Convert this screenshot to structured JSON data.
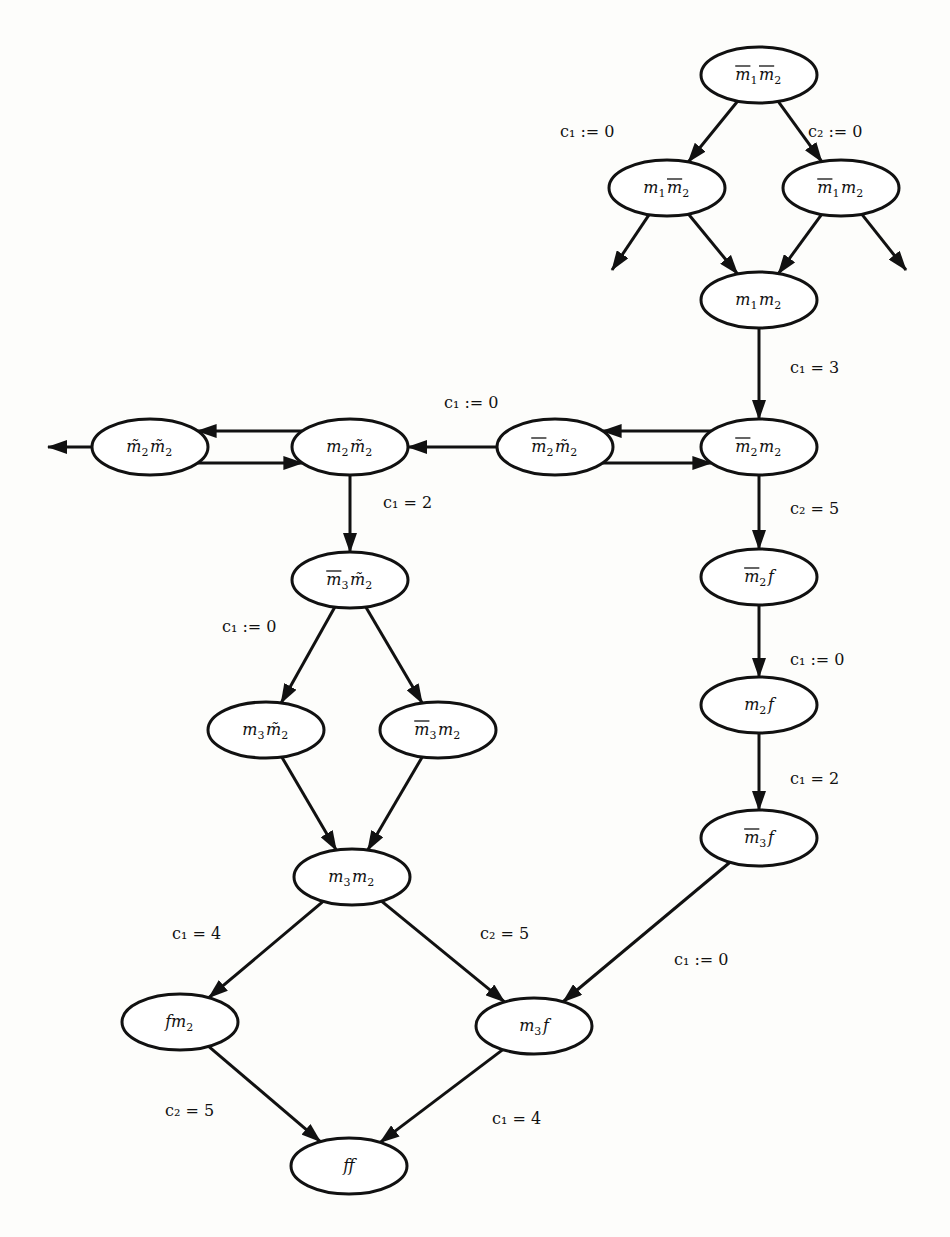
{
  "diagram": {
    "type": "state-transition-graph",
    "nodes": [
      {
        "id": "n1",
        "label": "m̄₁m̄₂",
        "parts": [
          {
            "b": "m",
            "s": "1",
            "bar": true
          },
          {
            "b": "m",
            "s": "2",
            "bar": true
          }
        ],
        "x": 759,
        "y": 75
      },
      {
        "id": "n2",
        "label": "m₁m̄₂",
        "parts": [
          {
            "b": "m",
            "s": "1",
            "bar": false
          },
          {
            "b": "m",
            "s": "2",
            "bar": true
          }
        ],
        "x": 667,
        "y": 188
      },
      {
        "id": "n3",
        "label": "m̄₁m₂",
        "parts": [
          {
            "b": "m",
            "s": "1",
            "bar": true
          },
          {
            "b": "m",
            "s": "2",
            "bar": false
          }
        ],
        "x": 841,
        "y": 188
      },
      {
        "id": "n4",
        "label": "m₁m₂",
        "parts": [
          {
            "b": "m",
            "s": "1",
            "bar": false
          },
          {
            "b": "m",
            "s": "2",
            "bar": false
          }
        ],
        "x": 759,
        "y": 300
      },
      {
        "id": "n5",
        "label": "m̄₂m₂",
        "parts": [
          {
            "b": "m",
            "s": "2",
            "bar": true
          },
          {
            "b": "m",
            "s": "2",
            "bar": false
          }
        ],
        "x": 759,
        "y": 447
      },
      {
        "id": "n6",
        "label": "m̄₂m̃₂",
        "parts": [
          {
            "b": "m",
            "s": "2",
            "bar": true
          },
          {
            "b": "m̃",
            "s": "2",
            "bar": false
          }
        ],
        "x": 555,
        "y": 447
      },
      {
        "id": "n7",
        "label": "m₂m̃₂",
        "parts": [
          {
            "b": "m",
            "s": "2",
            "bar": false
          },
          {
            "b": "m̃",
            "s": "2",
            "bar": false
          }
        ],
        "x": 350,
        "y": 447
      },
      {
        "id": "n8",
        "label": "m̃₂m̃₂",
        "parts": [
          {
            "b": "m̃",
            "s": "2",
            "bar": false
          },
          {
            "b": "m̃",
            "s": "2",
            "bar": false
          }
        ],
        "x": 150,
        "y": 447
      },
      {
        "id": "n9",
        "label": "m̄₃m̃₂",
        "parts": [
          {
            "b": "m",
            "s": "3",
            "bar": true
          },
          {
            "b": "m̃",
            "s": "2",
            "bar": false
          }
        ],
        "x": 350,
        "y": 580
      },
      {
        "id": "n10",
        "label": "m₃m̃₂",
        "parts": [
          {
            "b": "m",
            "s": "3",
            "bar": false
          },
          {
            "b": "m̃",
            "s": "2",
            "bar": false
          }
        ],
        "x": 266,
        "y": 730
      },
      {
        "id": "n11",
        "label": "m̄₃m₂",
        "parts": [
          {
            "b": "m",
            "s": "3",
            "bar": true
          },
          {
            "b": "m",
            "s": "2",
            "bar": false
          }
        ],
        "x": 438,
        "y": 730
      },
      {
        "id": "n12",
        "label": "m₃m₂",
        "parts": [
          {
            "b": "m",
            "s": "3",
            "bar": false
          },
          {
            "b": "m",
            "s": "2",
            "bar": false
          }
        ],
        "x": 352,
        "y": 877
      },
      {
        "id": "n13",
        "label": "m̄₂f",
        "parts": [
          {
            "b": "m",
            "s": "2",
            "bar": true
          },
          {
            "b": "f",
            "s": "",
            "bar": false
          }
        ],
        "x": 759,
        "y": 577
      },
      {
        "id": "n14",
        "label": "m₂f",
        "parts": [
          {
            "b": "m",
            "s": "2",
            "bar": false
          },
          {
            "b": "f",
            "s": "",
            "bar": false
          }
        ],
        "x": 759,
        "y": 705
      },
      {
        "id": "n15",
        "label": "m̄₃f",
        "parts": [
          {
            "b": "m",
            "s": "3",
            "bar": true
          },
          {
            "b": "f",
            "s": "",
            "bar": false
          }
        ],
        "x": 759,
        "y": 838
      },
      {
        "id": "n16",
        "label": "fm₂",
        "parts": [
          {
            "b": "f",
            "s": "",
            "bar": false
          },
          {
            "b": "m",
            "s": "2",
            "bar": false
          }
        ],
        "x": 180,
        "y": 1022
      },
      {
        "id": "n17",
        "label": "m₃f",
        "parts": [
          {
            "b": "m",
            "s": "3",
            "bar": false
          },
          {
            "b": "f",
            "s": "",
            "bar": false
          }
        ],
        "x": 534,
        "y": 1026
      },
      {
        "id": "n18",
        "label": "ff",
        "parts": [
          {
            "b": "f",
            "s": "",
            "bar": false
          },
          {
            "b": "f",
            "s": "",
            "bar": false
          }
        ],
        "x": 349,
        "y": 1166
      }
    ],
    "edges": [
      {
        "from": "n1",
        "to": "n2",
        "label": "c₁ := 0",
        "lx": 560,
        "ly": 137
      },
      {
        "from": "n1",
        "to": "n3",
        "label": "c₂ := 0",
        "lx": 808,
        "ly": 137
      },
      {
        "from": "n2",
        "to": "stub-left-2",
        "label": ""
      },
      {
        "from": "n2",
        "to": "n4",
        "label": ""
      },
      {
        "from": "n3",
        "to": "n4",
        "label": ""
      },
      {
        "from": "n3",
        "to": "stub-right-3",
        "label": ""
      },
      {
        "from": "n4",
        "to": "n5",
        "label": "c₁ = 3",
        "lx": 790,
        "ly": 373
      },
      {
        "from": "n5",
        "to": "n6",
        "label": "c₁ := 0",
        "lx": 444,
        "ly": 408,
        "offset": -16
      },
      {
        "from": "n6",
        "to": "n5",
        "label": "",
        "offset": 16
      },
      {
        "from": "n6",
        "to": "n7",
        "label": ""
      },
      {
        "from": "n7",
        "to": "n8",
        "label": "",
        "offset": -16
      },
      {
        "from": "n8",
        "to": "n7",
        "label": "",
        "offset": 16
      },
      {
        "from": "n8",
        "to": "stub-left-8",
        "label": ""
      },
      {
        "from": "n7",
        "to": "n9",
        "label": "c₁ = 2",
        "lx": 383,
        "ly": 508
      },
      {
        "from": "n9",
        "to": "n10",
        "label": "c₁ := 0",
        "lx": 222,
        "ly": 632
      },
      {
        "from": "n9",
        "to": "n11",
        "label": ""
      },
      {
        "from": "n10",
        "to": "n12",
        "label": ""
      },
      {
        "from": "n11",
        "to": "n12",
        "label": ""
      },
      {
        "from": "n5",
        "to": "n13",
        "label": "c₂ = 5",
        "lx": 790,
        "ly": 514
      },
      {
        "from": "n13",
        "to": "n14",
        "label": "c₁ := 0",
        "lx": 790,
        "ly": 665
      },
      {
        "from": "n14",
        "to": "n15",
        "label": "c₁ = 2",
        "lx": 790,
        "ly": 784
      },
      {
        "from": "n12",
        "to": "n16",
        "label": "c₁ = 4",
        "lx": 172,
        "ly": 939
      },
      {
        "from": "n12",
        "to": "n17",
        "label": "c₂ = 5",
        "lx": 480,
        "ly": 939
      },
      {
        "from": "n15",
        "to": "n17",
        "label": "c₁ := 0",
        "lx": 674,
        "ly": 965
      },
      {
        "from": "n16",
        "to": "n18",
        "label": "c₂ = 5",
        "lx": 165,
        "ly": 1116
      },
      {
        "from": "n17",
        "to": "n18",
        "label": "c₁ = 4",
        "lx": 492,
        "ly": 1124
      }
    ],
    "stubs": {
      "stub-left-2": {
        "x": 612,
        "y": 270
      },
      "stub-right-3": {
        "x": 906,
        "y": 270
      },
      "stub-left-8": {
        "x": 48,
        "y": 447
      }
    },
    "node_rx": 58,
    "node_ry": 28,
    "stroke_color": "#111111",
    "background_color": "#fdfdfb"
  }
}
